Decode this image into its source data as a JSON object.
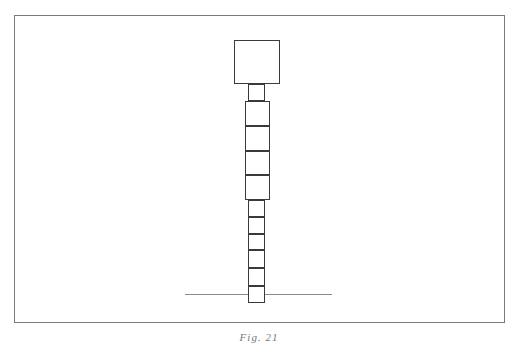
{
  "figure": {
    "caption": "Fig. 21",
    "frame": {
      "left": 14,
      "top": 15,
      "width": 491,
      "height": 308
    },
    "ground_line": {
      "left": 185,
      "top": 294,
      "width": 147
    },
    "column": {
      "head": {
        "left": 234,
        "top": 40,
        "width": 46,
        "height": 44
      },
      "neck": {
        "left": 248,
        "top": 84,
        "width": 17,
        "height": 17
      },
      "wide_segments": [
        {
          "left": 245,
          "top": 101,
          "width": 25,
          "height": 25
        },
        {
          "left": 245,
          "top": 126,
          "width": 25,
          "height": 25
        },
        {
          "left": 245,
          "top": 151,
          "width": 25,
          "height": 24
        },
        {
          "left": 245,
          "top": 175,
          "width": 25,
          "height": 25
        }
      ],
      "narrow_segments": [
        {
          "left": 248,
          "top": 200,
          "width": 17,
          "height": 17
        },
        {
          "left": 248,
          "top": 217,
          "width": 17,
          "height": 17
        },
        {
          "left": 248,
          "top": 234,
          "width": 17,
          "height": 16
        },
        {
          "left": 248,
          "top": 250,
          "width": 17,
          "height": 18
        },
        {
          "left": 248,
          "top": 268,
          "width": 17,
          "height": 18
        },
        {
          "left": 248,
          "top": 286,
          "width": 17,
          "height": 17
        }
      ]
    },
    "colors": {
      "line": "#3a3a3a",
      "frame": "#7a7a7a",
      "ground": "#8a8a8a"
    }
  }
}
